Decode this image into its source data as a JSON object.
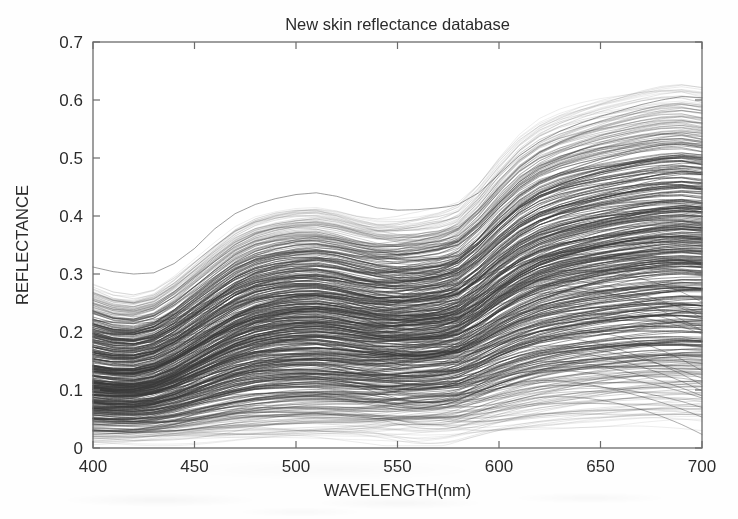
{
  "chart_data": {
    "type": "line",
    "title": "New skin reflectance database",
    "xlabel": "WAVELENGTH(nm)",
    "ylabel": "REFLECTANCE",
    "xlim": [
      400,
      700
    ],
    "ylim": [
      0,
      0.7
    ],
    "xticks": [
      400,
      450,
      500,
      550,
      600,
      650,
      700
    ],
    "xtick_labels": [
      "400",
      "450",
      "500",
      "550",
      "600",
      "650",
      "700"
    ],
    "yticks": [
      0,
      0.1,
      0.2,
      0.3,
      0.4,
      0.5,
      0.6,
      0.7
    ],
    "ytick_labels": [
      "0",
      "0.1",
      "0.2",
      "0.3",
      "0.4",
      "0.5",
      "0.6",
      "0.7"
    ],
    "grid": false,
    "legend": null,
    "series_count": 420,
    "line_color": "#3a3a3a",
    "x": [
      400,
      410,
      420,
      430,
      440,
      450,
      460,
      470,
      480,
      490,
      500,
      510,
      520,
      530,
      540,
      550,
      560,
      570,
      575,
      580,
      590,
      600,
      610,
      620,
      630,
      640,
      650,
      660,
      670,
      680,
      690,
      700
    ],
    "envelope_upper": [
      0.275,
      0.262,
      0.258,
      0.268,
      0.292,
      0.322,
      0.352,
      0.38,
      0.398,
      0.408,
      0.414,
      0.416,
      0.41,
      0.4,
      0.392,
      0.39,
      0.392,
      0.398,
      0.404,
      0.412,
      0.448,
      0.492,
      0.53,
      0.556,
      0.572,
      0.584,
      0.594,
      0.602,
      0.61,
      0.616,
      0.618,
      0.612
    ],
    "envelope_lower": [
      0.012,
      0.012,
      0.012,
      0.013,
      0.014,
      0.015,
      0.016,
      0.017,
      0.018,
      0.019,
      0.02,
      0.021,
      0.021,
      0.021,
      0.021,
      0.021,
      0.021,
      0.022,
      0.022,
      0.023,
      0.026,
      0.03,
      0.034,
      0.038,
      0.041,
      0.044,
      0.046,
      0.048,
      0.05,
      0.051,
      0.052,
      0.052
    ],
    "envelope_median": [
      0.118,
      0.114,
      0.114,
      0.121,
      0.136,
      0.156,
      0.176,
      0.194,
      0.207,
      0.214,
      0.218,
      0.219,
      0.215,
      0.209,
      0.204,
      0.203,
      0.205,
      0.209,
      0.213,
      0.218,
      0.24,
      0.266,
      0.288,
      0.304,
      0.315,
      0.323,
      0.33,
      0.336,
      0.341,
      0.345,
      0.347,
      0.345
    ],
    "outlier_top": [
      0.312,
      0.304,
      0.3,
      0.302,
      0.318,
      0.344,
      0.378,
      0.404,
      0.42,
      0.43,
      0.437,
      0.44,
      0.434,
      0.424,
      0.414,
      0.41,
      0.411,
      0.414,
      0.416,
      0.42,
      0.44,
      0.472,
      0.504,
      0.528,
      0.546,
      0.56,
      0.572,
      0.582,
      0.592,
      0.6,
      0.606,
      0.604
    ]
  },
  "axes": {
    "title": "New skin reflectance database",
    "xlabel": "WAVELENGTH(nm)",
    "ylabel": "REFLECTANCE"
  },
  "style": {
    "line_color": "#3a3a3a",
    "axis_color": "#6b6b6b",
    "text_color": "#2b2b2b",
    "background": "#fefefe"
  }
}
